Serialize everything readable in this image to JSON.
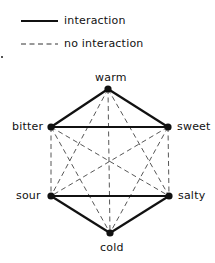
{
  "legend": {
    "solid_label": "interaction",
    "dashed_label": "no interaction"
  },
  "nodes": [
    {
      "id": "warm",
      "label": "warm",
      "x": 108,
      "y": 89
    },
    {
      "id": "bitter",
      "label": "bitter",
      "x": 51,
      "y": 127
    },
    {
      "id": "sweet",
      "label": "sweet",
      "x": 168,
      "y": 127
    },
    {
      "id": "sour",
      "label": "sour",
      "x": 51,
      "y": 196
    },
    {
      "id": "salty",
      "label": "salty",
      "x": 169,
      "y": 196
    },
    {
      "id": "cold",
      "label": "cold",
      "x": 110,
      "y": 233
    }
  ],
  "edges": {
    "interaction": [
      [
        "warm",
        "bitter"
      ],
      [
        "warm",
        "sweet"
      ],
      [
        "bitter",
        "sweet"
      ],
      [
        "sour",
        "salty"
      ],
      [
        "sour",
        "cold"
      ],
      [
        "salty",
        "cold"
      ]
    ],
    "no_interaction": [
      [
        "bitter",
        "sour"
      ],
      [
        "sweet",
        "salty"
      ],
      [
        "bitter",
        "salty"
      ],
      [
        "sweet",
        "sour"
      ],
      [
        "warm",
        "cold"
      ],
      [
        "warm",
        "sour"
      ],
      [
        "warm",
        "salty"
      ],
      [
        "bitter",
        "cold"
      ],
      [
        "sweet",
        "cold"
      ]
    ]
  },
  "style": {
    "line_color": "#111111",
    "dash_color": "#444444"
  }
}
